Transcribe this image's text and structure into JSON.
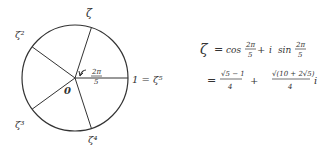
{
  "diagram": {
    "labels": {
      "z1": "ζ",
      "z2": "ζ²",
      "z3": "ζ³",
      "z4": "ζ⁴",
      "z5": "1 = ζ⁵",
      "origin": "0",
      "angle_num": "2π",
      "angle_den": "5"
    }
  },
  "formula": {
    "line1": {
      "lhs": "ζ",
      "eq": "=",
      "cos": "cos",
      "num1": "2π",
      "den1": "5",
      "plus": "+",
      "i": "i",
      "sin": "sin",
      "num2": "2π",
      "den2": "5"
    },
    "line2": {
      "eq": "=",
      "frac1_num": "√5 − 1",
      "frac1_den": "4",
      "plus": "+",
      "frac2_num": "√(10 + 2√5)",
      "frac2_den": "4",
      "i": "i"
    }
  }
}
